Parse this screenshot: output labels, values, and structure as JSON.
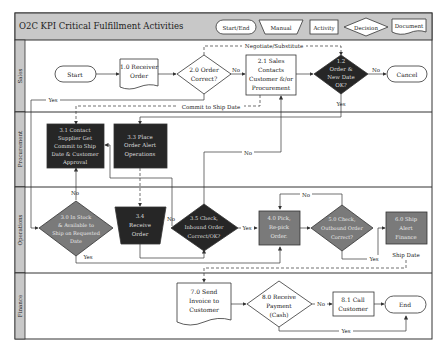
{
  "title": "O2C KPI Critical Fulfillment Activities",
  "legend": {
    "start_end": "Start/End",
    "manual": "Manual",
    "activity": "Activity",
    "decision": "Decision",
    "document": "Document"
  },
  "lanes": {
    "sales": "Sales",
    "procurement": "Procurement",
    "operations": "Operations",
    "finance": "Finance"
  },
  "nodes": {
    "start": "Start",
    "n1_0": [
      "1.0 Receiver",
      "Order"
    ],
    "n2_0": [
      "2.0 Order",
      "Correct?"
    ],
    "n2_1": [
      "2.1 Sales",
      "Contacts",
      "Customer &/or",
      "Procurement"
    ],
    "n1_2": [
      "1.2",
      "Order &",
      "New Date",
      "OK?"
    ],
    "cancel": "Cancel",
    "n3_1": [
      "3.1 Contact",
      "Supplier Get",
      "Commit to Ship",
      "Date & Customer",
      "Approval"
    ],
    "n3_3": [
      "3.3 Place",
      "Order Alert",
      "Operations"
    ],
    "n3_0": [
      "3.0 In Stock",
      "& Available to",
      "Ship on Requested",
      "Date"
    ],
    "n3_4": [
      "3.4",
      "Receive",
      "Order"
    ],
    "n3_5": [
      "3.5 Check,",
      "Inbound Order",
      "Correct/OK?"
    ],
    "n4_0": [
      "4.0 Pick,",
      "Re-pick",
      "Order."
    ],
    "n5_0": [
      "5.0 Check,",
      "Outbound Order",
      "Correct?"
    ],
    "n6_0": [
      "6.0 Ship",
      "Alert",
      "Finance"
    ],
    "n7_0": [
      "7.0 Send",
      "Invoice to",
      "Customer"
    ],
    "n8_0": [
      "8.0 Receive",
      "Payment",
      "(Cash)"
    ],
    "n8_1": [
      "8.1 Call",
      "Customer"
    ],
    "end": "End"
  },
  "edge_labels": {
    "negotiate": "Negotiate/Substitute",
    "commit": "Commit to Ship Date",
    "yes_sales": "Yes",
    "no_2_0": "No",
    "no_1_2": "No",
    "yes_1_2": "Yes",
    "no_3_5": "No",
    "no_3_0": "No",
    "yes_3_0": "Yes",
    "no_3_4": "No",
    "yes_3_5": "Yes",
    "no_5_0": "No",
    "yes_5_0": "Yes",
    "ship_date": "Ship Date",
    "no_8_0": "No",
    "yes_8_0": "Yes"
  },
  "colors": {
    "header_bg": "#c8c8c8",
    "lane_label_bg": "#c8c8c8",
    "dark_fill": "#262626",
    "mid_fill": "#7a7a7a",
    "line": "#333333"
  }
}
